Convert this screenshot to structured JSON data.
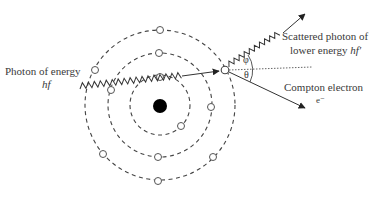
{
  "figure": {
    "type": "Compton scattering atomic diagram",
    "labels": {
      "incoming_line1": "Photon of energy",
      "incoming_line2": "hf",
      "scattered_line1": "Scattered photon of",
      "scattered_line2_prefix": "lower energy ",
      "scattered_line2_symbol": "hf′",
      "electron_line1": "Compton electron",
      "electron_line2": "e⁻",
      "angle_phi": "φ",
      "angle_theta": "θ"
    },
    "colors": {
      "line": "#333333",
      "nucleus": "#000000",
      "electron_fill": "#ffffff",
      "text": "#3a3a3a"
    },
    "nucleus": {
      "cx": 160,
      "cy": 105,
      "r": 7
    },
    "orbits": [
      {
        "name": "inner",
        "r": 30
      },
      {
        "name": "middle",
        "r": 52
      },
      {
        "name": "outer",
        "r": 75
      }
    ],
    "electrons": [
      {
        "x": 160,
        "y": 30
      },
      {
        "x": 95,
        "y": 70
      },
      {
        "x": 103,
        "y": 154
      },
      {
        "x": 158,
        "y": 181
      },
      {
        "x": 213,
        "y": 157
      },
      {
        "x": 159,
        "y": 53
      },
      {
        "x": 111,
        "y": 90
      },
      {
        "x": 158,
        "y": 157
      },
      {
        "x": 211,
        "y": 107
      },
      {
        "x": 160,
        "y": 76
      },
      {
        "x": 181,
        "y": 126
      },
      {
        "x": 225,
        "y": 70
      }
    ]
  }
}
